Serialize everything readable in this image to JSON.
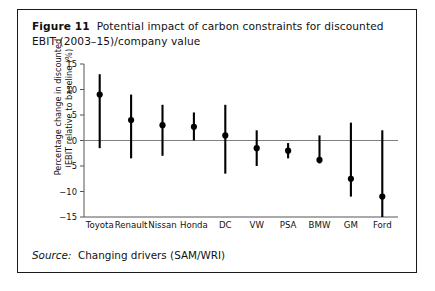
{
  "figure": {
    "number": "Figure 11",
    "caption": "Potential impact of carbon constraints for discounted EBIT (2003–15)/company value",
    "source_label": "Source:",
    "source_text": "Changing drivers (SAM/WRI)"
  },
  "colors": {
    "frame": "#1a1a1a",
    "marker": "#000000",
    "range_line": "#000000",
    "zero_line": "#808080",
    "axis": "#555555",
    "background": "#ffffff",
    "text": "#111111"
  },
  "chart_data": {
    "type": "scatter",
    "title": "Potential impact of carbon constraints for discounted EBIT (2003–15)/company value",
    "xlabel": "",
    "ylabel": "Percentage change in discounted EBIT relative to baseline (%)",
    "ylim": [
      -15,
      15
    ],
    "yticks": [
      15,
      10,
      5,
      0,
      -5,
      -10,
      -15
    ],
    "ytick_labels": [
      "15",
      "10",
      "5",
      "0",
      "−5",
      "−10",
      "−15"
    ],
    "grid": false,
    "legend": null,
    "zero_reference_line": 0,
    "categories": [
      "Toyota",
      "Renault",
      "Nissan",
      "Honda",
      "DC",
      "VW",
      "PSA",
      "BMW",
      "GM",
      "Ford"
    ],
    "series": [
      {
        "name": "Range high",
        "values": [
          13,
          9,
          7,
          5.5,
          7,
          2,
          -0.5,
          1,
          3.5,
          2
        ]
      },
      {
        "name": "Central estimate",
        "values": [
          9,
          4,
          3,
          2.7,
          1,
          -1.5,
          -2,
          -3.8,
          -7.5,
          -11
        ]
      },
      {
        "name": "Range low",
        "values": [
          -1.5,
          -3.5,
          -3,
          0,
          -6.5,
          -5,
          -3.5,
          -4.5,
          -11,
          -15
        ]
      }
    ]
  }
}
